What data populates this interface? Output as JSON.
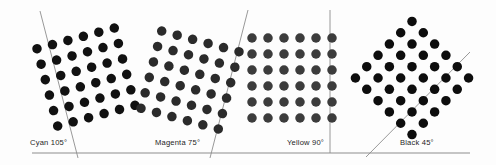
{
  "figure": {
    "kind": "halftone-screen-angles-diagram",
    "background_color": "#fdfdfd",
    "baseline": {
      "color": "#8d8d8d",
      "y": 153,
      "x_start": 32,
      "x_end": 470
    },
    "dot_grid": {
      "rows": 6,
      "cols": 6,
      "spacing_px": 16,
      "dot_diameter_px": 9.5
    }
  },
  "panels": [
    {
      "id": "cyan",
      "label": "Cyan 105°",
      "angle_deg": 105,
      "label_x": 30,
      "label_y": 139,
      "dot_color": "#111111",
      "grid_center_x": 86,
      "grid_center_y": 77,
      "grid_rotation_deg": -15,
      "angle_line": {
        "x1": 40,
        "y1": 11,
        "x2": 78,
        "y2": 158,
        "color": "#8d8d8d"
      }
    },
    {
      "id": "magenta",
      "label": "Magenta 75°",
      "angle_deg": 75,
      "label_x": 155,
      "label_y": 139,
      "dot_color": "#2b2b2b",
      "grid_center_x": 190,
      "grid_center_y": 80,
      "grid_rotation_deg": 15,
      "angle_line": {
        "x1": 248,
        "y1": 10,
        "x2": 210,
        "y2": 158,
        "color": "#8d8d8d"
      }
    },
    {
      "id": "yellow",
      "label": "Yellow 90°",
      "angle_deg": 90,
      "label_x": 287,
      "label_y": 139,
      "dot_color": "#3c3c3c",
      "grid_center_x": 292,
      "grid_center_y": 78,
      "grid_rotation_deg": 0,
      "angle_line": {
        "x1": 330,
        "y1": 10,
        "x2": 330,
        "y2": 153,
        "color": "#8d8d8d"
      }
    },
    {
      "id": "black",
      "label": "Black 45°",
      "angle_deg": 45,
      "label_x": 400,
      "label_y": 139,
      "dot_color": "#0d0d0d",
      "grid_center_x": 412,
      "grid_center_y": 78,
      "grid_rotation_deg": 45,
      "angle_line": {
        "x1": 366,
        "y1": 157,
        "x2": 470,
        "y2": 52,
        "color": "#8d8d8d"
      }
    }
  ],
  "chart_data": {
    "type": "scatter",
    "xlabel": "",
    "ylabel": "",
    "series": [
      {
        "name": "Cyan 105°",
        "rotation_deg": -15,
        "nominal_angle_deg": 105,
        "points": 36,
        "color": "#111111"
      },
      {
        "name": "Magenta 75°",
        "rotation_deg": 15,
        "nominal_angle_deg": 75,
        "points": 36,
        "color": "#2b2b2b"
      },
      {
        "name": "Yellow 90°",
        "rotation_deg": 0,
        "nominal_angle_deg": 90,
        "points": 36,
        "color": "#3c3c3c"
      },
      {
        "name": "Black 45°",
        "rotation_deg": 45,
        "nominal_angle_deg": 45,
        "points": 36,
        "color": "#0d0d0d"
      }
    ],
    "grid": false,
    "legend_position": "below-each-panel"
  }
}
